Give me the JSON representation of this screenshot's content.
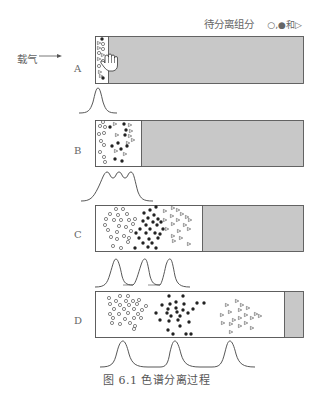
{
  "legend": {
    "text": "待分离组分",
    "symbols": "○,●和▷"
  },
  "carrier": {
    "label": "载气"
  },
  "stages": [
    {
      "label": "A",
      "white_end": 108
    },
    {
      "label": "B",
      "white_end": 141
    },
    {
      "label": "C",
      "white_end": 202
    },
    {
      "label": "D",
      "white_end": 284
    }
  ],
  "caption": "图 6.1   色谱分离过程",
  "colors": {
    "stationary": "#c8c8c8",
    "border": "#555555",
    "curve": "#444444"
  }
}
